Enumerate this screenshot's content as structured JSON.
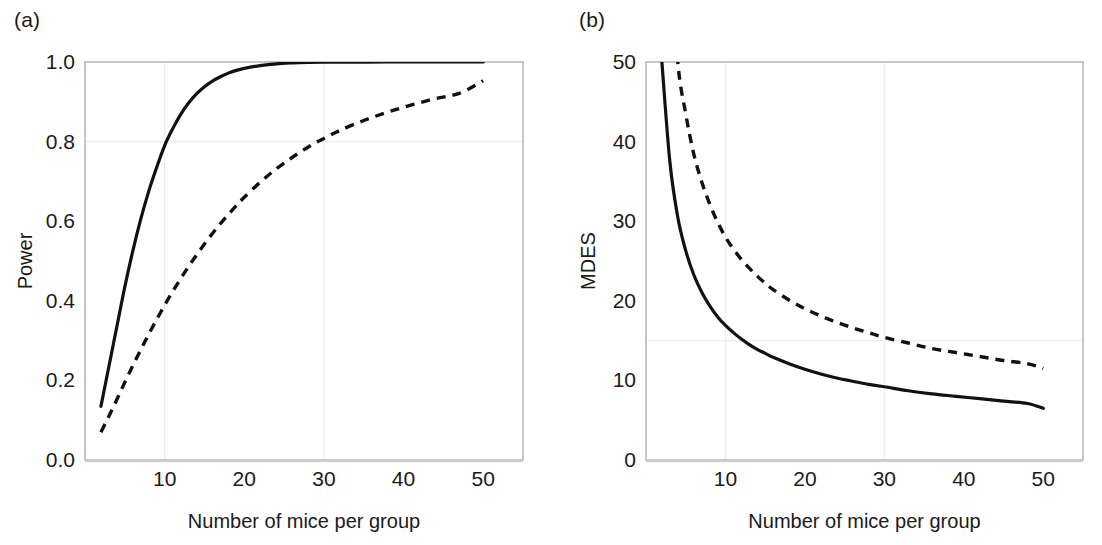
{
  "figure": {
    "background": "#ffffff",
    "curve_color": "#111111",
    "frame_color": "#b9b9b9",
    "grid_color": "#ededed"
  },
  "panels": [
    {
      "id": "a",
      "label": "(a)"
    },
    {
      "id": "b",
      "label": "(b)"
    }
  ],
  "chart_data": [
    {
      "type": "line",
      "panel": "(a)",
      "title": "",
      "xlabel": "Number of mice per group",
      "ylabel": "Power",
      "xlim": [
        0,
        55
      ],
      "ylim": [
        0.0,
        1.0
      ],
      "xticks": [
        10,
        20,
        30,
        40,
        50
      ],
      "xtick_labels": [
        "10",
        "20",
        "30",
        "40",
        "50"
      ],
      "yticks": [
        0.0,
        0.2,
        0.4,
        0.6,
        0.8,
        1.0
      ],
      "ytick_labels": [
        "0.0",
        "0.2",
        "0.4",
        "0.6",
        "0.8",
        "1.0"
      ],
      "grid": {
        "x": [
          10,
          30
        ],
        "y": [
          0.8
        ]
      },
      "legend": "none",
      "x": [
        2,
        3,
        4,
        5,
        6,
        7,
        8,
        9,
        10,
        11,
        12,
        13,
        14,
        15,
        16,
        17,
        18,
        19,
        20,
        22,
        24,
        26,
        28,
        30,
        32,
        35,
        38,
        41,
        44,
        47,
        50
      ],
      "series": [
        {
          "name": "solid",
          "style": "solid",
          "values": [
            0.135,
            0.235,
            0.335,
            0.435,
            0.525,
            0.605,
            0.675,
            0.735,
            0.79,
            0.832,
            0.868,
            0.897,
            0.92,
            0.938,
            0.952,
            0.963,
            0.972,
            0.979,
            0.984,
            0.991,
            0.9955,
            0.9976,
            0.9988,
            0.9994,
            0.9997,
            0.9999,
            1.0,
            1.0,
            1.0,
            1.0,
            1.0
          ]
        },
        {
          "name": "dashed",
          "style": "dashed",
          "values": [
            0.07,
            0.11,
            0.152,
            0.195,
            0.237,
            0.277,
            0.316,
            0.353,
            0.389,
            0.423,
            0.455,
            0.486,
            0.515,
            0.543,
            0.569,
            0.594,
            0.617,
            0.639,
            0.66,
            0.698,
            0.731,
            0.76,
            0.786,
            0.808,
            0.828,
            0.853,
            0.874,
            0.892,
            0.908,
            0.921,
            0.953
          ]
        }
      ]
    },
    {
      "type": "line",
      "panel": "(b)",
      "title": "",
      "xlabel": "Number of mice per group",
      "ylabel": "MDES",
      "xlim": [
        0,
        55
      ],
      "ylim": [
        0,
        50
      ],
      "xticks": [
        10,
        20,
        30,
        40,
        50
      ],
      "xtick_labels": [
        "10",
        "20",
        "30",
        "40",
        "50"
      ],
      "yticks": [
        0,
        10,
        20,
        30,
        40,
        50
      ],
      "ytick_labels": [
        "0",
        "10",
        "20",
        "30",
        "40",
        "50"
      ],
      "grid": {
        "x": [
          10,
          30
        ],
        "y": [
          15
        ]
      },
      "legend": "none",
      "x": [
        2,
        3,
        4,
        5,
        6,
        7,
        8,
        9,
        10,
        11,
        12,
        13,
        14,
        15,
        16,
        18,
        20,
        22,
        24,
        26,
        28,
        30,
        33,
        36,
        39,
        42,
        45,
        48,
        50
      ],
      "series": [
        {
          "name": "solid",
          "style": "solid",
          "values": [
            50,
            37.5,
            30.5,
            26.3,
            23.3,
            21.1,
            19.4,
            18.0,
            16.9,
            16.0,
            15.2,
            14.5,
            13.9,
            13.4,
            12.9,
            12.1,
            11.4,
            10.8,
            10.3,
            9.9,
            9.5,
            9.2,
            8.7,
            8.3,
            8.0,
            7.7,
            7.4,
            7.1,
            6.5
          ]
        },
        {
          "name": "dashed",
          "style": "dashed",
          "values": [
            85,
            65,
            50,
            43.5,
            38.5,
            35.0,
            32.2,
            29.9,
            28.0,
            26.5,
            25.2,
            24.1,
            23.1,
            22.2,
            21.4,
            20.1,
            19.0,
            18.1,
            17.3,
            16.6,
            16.0,
            15.4,
            14.7,
            14.0,
            13.5,
            13.0,
            12.5,
            12.1,
            11.5
          ]
        }
      ]
    }
  ]
}
